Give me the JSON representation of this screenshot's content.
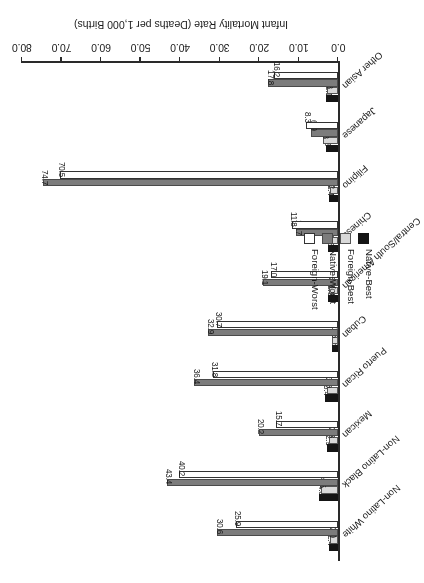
{
  "chart_data": {
    "type": "bar",
    "title": "",
    "xlabel": "",
    "ylabel": "Infant Mortality Rate (Deaths per 1,000 Births)",
    "ylim": [
      0.0,
      80.0
    ],
    "ytick_labels": [
      "0.0",
      "10.0",
      "20.0",
      "30.0",
      "40.0",
      "50.0",
      "60.0",
      "70.0",
      "80.0"
    ],
    "ytick_values": [
      0,
      10,
      20,
      30,
      40,
      50,
      60,
      70,
      80
    ],
    "grid": false,
    "legend_position": "upper-left",
    "orientation": "vertical-bars-rotated-180",
    "categories": [
      "Non-Latino White",
      "Non-Latino Black",
      "Mexican",
      "Puerto Rican",
      "Cuban",
      "Central/South American",
      "Chinese",
      "Filipino",
      "Japanese",
      "Other Asian"
    ],
    "series": [
      {
        "name": "Native-Best",
        "color": "#151515",
        "values": [
          2.4,
          4.8,
          2.9,
          3.4,
          1.6,
          2.6,
          2.6,
          2.4,
          3.2,
          3.1
        ],
        "labels": [
          "2.4",
          "4.8",
          "2.9",
          "3.4",
          "1.6",
          "2.6",
          "2.6",
          "2.4",
          "3.2",
          "3.1"
        ]
      },
      {
        "name": "Foreign-Best",
        "color": "#d9d9d9",
        "values": [
          2.0,
          4.5,
          2.3,
          3.0,
          1.5,
          2.3,
          2.8,
          2.2,
          3.8,
          2.8
        ],
        "labels": [
          "2.0",
          "4.5",
          "2.3",
          "3.0",
          "1.5",
          "2.3",
          "2.8",
          "2.2",
          "3.8",
          "2.8"
        ]
      },
      {
        "name": "Native-Worst",
        "color": "#7c7c7c",
        "values": [
          30.6,
          43.4,
          20.2,
          36.4,
          32.9,
          19.1,
          10.7,
          74.7,
          6.9,
          17.8
        ],
        "labels": [
          "30.6",
          "43.4",
          "20.2",
          "36.4",
          "32.9",
          "19.1",
          "10.7",
          "74.7",
          "6.9",
          "17.8"
        ]
      },
      {
        "name": "Foreign-Worst",
        "color": "#ffffff",
        "values": [
          25.9,
          40.2,
          15.7,
          31.8,
          30.7,
          17.0,
          11.8,
          70.5,
          8.3,
          16.2
        ],
        "labels": [
          "25.9",
          "40.2",
          "15.7",
          "31.8",
          "30.7",
          "17.0",
          "11.8",
          "70.5",
          "8.3",
          "16.2"
        ]
      }
    ]
  },
  "legend": {
    "items": [
      {
        "label": "Native-Best"
      },
      {
        "label": "Foreign-Best"
      },
      {
        "label": "Native-Worst"
      },
      {
        "label": "Foreign-Worst"
      }
    ]
  },
  "axis": {
    "value_axis_title": "Infant Mortality Rate (Deaths per 1,000 Births)"
  }
}
